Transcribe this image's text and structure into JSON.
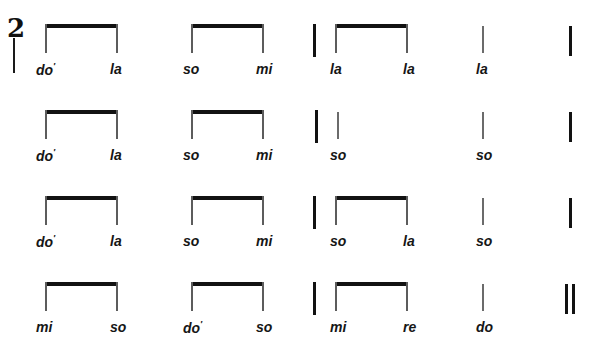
{
  "document": {
    "kind": "music-notation-rhythm-exercise",
    "notation": "stem-and-beam rhythm staff with solfege syllable labels",
    "time_signature": "2",
    "ghost_top_text": "cut-off text line"
  },
  "systems": [
    {
      "index": 1,
      "y_beam": 24,
      "y_label": 62,
      "time_signature": "2",
      "opening_barline": true,
      "closing_barline": "single",
      "measures": [
        {
          "index": 1,
          "start_barline": false,
          "groups": [
            {
              "type": "beamed-pair",
              "x": 45,
              "width": 73,
              "syllables": [
                "do'",
                "la"
              ]
            }
          ]
        },
        {
          "index": 2,
          "start_barline": false,
          "groups": [
            {
              "type": "beamed-pair",
              "x": 191,
              "width": 73,
              "syllables": [
                "so",
                "mi"
              ]
            }
          ]
        },
        {
          "index": 3,
          "start_barline": true,
          "groups": [
            {
              "type": "beamed-pair",
              "x": 335,
              "width": 73,
              "syllables": [
                "la",
                "la"
              ]
            }
          ]
        },
        {
          "index": 4,
          "start_barline": false,
          "groups": [
            {
              "type": "single-stem",
              "x": 482,
              "syllables": [
                "la"
              ]
            }
          ]
        }
      ],
      "syllable_labels": [
        {
          "text": "do",
          "prime": true,
          "x": 36
        },
        {
          "text": "la",
          "prime": false,
          "x": 110
        },
        {
          "text": "so",
          "prime": false,
          "x": 183
        },
        {
          "text": "mi",
          "prime": false,
          "x": 256
        },
        {
          "text": "la",
          "prime": false,
          "x": 330
        },
        {
          "text": "la",
          "prime": false,
          "x": 403
        },
        {
          "text": "la",
          "prime": false,
          "x": 476
        }
      ]
    },
    {
      "index": 2,
      "y_beam": 110,
      "y_label": 148,
      "time_signature": null,
      "opening_barline": false,
      "closing_barline": "single",
      "measures": [
        {
          "index": 1,
          "start_barline": false,
          "groups": [
            {
              "type": "beamed-pair",
              "x": 45,
              "width": 73,
              "syllables": [
                "do'",
                "la"
              ]
            }
          ]
        },
        {
          "index": 2,
          "start_barline": false,
          "groups": [
            {
              "type": "beamed-pair",
              "x": 191,
              "width": 73,
              "syllables": [
                "so",
                "mi"
              ]
            }
          ]
        },
        {
          "index": 3,
          "start_barline": true,
          "groups": [
            {
              "type": "single-stem",
              "x": 337,
              "syllables": [
                "so"
              ]
            }
          ]
        },
        {
          "index": 4,
          "start_barline": false,
          "groups": [
            {
              "type": "single-stem",
              "x": 482,
              "syllables": [
                "so"
              ]
            }
          ]
        }
      ],
      "syllable_labels": [
        {
          "text": "do",
          "prime": true,
          "x": 36
        },
        {
          "text": "la",
          "prime": false,
          "x": 110
        },
        {
          "text": "so",
          "prime": false,
          "x": 183
        },
        {
          "text": "mi",
          "prime": false,
          "x": 256
        },
        {
          "text": "so",
          "prime": false,
          "x": 330
        },
        {
          "text": "so",
          "prime": false,
          "x": 476
        }
      ]
    },
    {
      "index": 3,
      "y_beam": 196,
      "y_label": 234,
      "time_signature": null,
      "opening_barline": false,
      "closing_barline": "single",
      "measures": [
        {
          "index": 1,
          "start_barline": false,
          "groups": [
            {
              "type": "beamed-pair",
              "x": 45,
              "width": 73,
              "syllables": [
                "do'",
                "la"
              ]
            }
          ]
        },
        {
          "index": 2,
          "start_barline": false,
          "groups": [
            {
              "type": "beamed-pair",
              "x": 191,
              "width": 73,
              "syllables": [
                "so",
                "mi"
              ]
            }
          ]
        },
        {
          "index": 3,
          "start_barline": true,
          "groups": [
            {
              "type": "beamed-pair",
              "x": 335,
              "width": 73,
              "syllables": [
                "so",
                "la"
              ]
            }
          ]
        },
        {
          "index": 4,
          "start_barline": false,
          "groups": [
            {
              "type": "single-stem",
              "x": 482,
              "syllables": [
                "so"
              ]
            }
          ]
        }
      ],
      "syllable_labels": [
        {
          "text": "do",
          "prime": true,
          "x": 36
        },
        {
          "text": "la",
          "prime": false,
          "x": 110
        },
        {
          "text": "so",
          "prime": false,
          "x": 183
        },
        {
          "text": "mi",
          "prime": false,
          "x": 256
        },
        {
          "text": "so",
          "prime": false,
          "x": 330
        },
        {
          "text": "la",
          "prime": false,
          "x": 403
        },
        {
          "text": "so",
          "prime": false,
          "x": 476
        }
      ]
    },
    {
      "index": 4,
      "y_beam": 282,
      "y_label": 320,
      "time_signature": null,
      "opening_barline": false,
      "closing_barline": "double-final",
      "measures": [
        {
          "index": 1,
          "start_barline": false,
          "groups": [
            {
              "type": "beamed-pair",
              "x": 45,
              "width": 73,
              "syllables": [
                "mi",
                "so"
              ]
            }
          ]
        },
        {
          "index": 2,
          "start_barline": false,
          "groups": [
            {
              "type": "beamed-pair",
              "x": 191,
              "width": 73,
              "syllables": [
                "do'",
                "so"
              ]
            }
          ]
        },
        {
          "index": 3,
          "start_barline": true,
          "groups": [
            {
              "type": "beamed-pair",
              "x": 335,
              "width": 73,
              "syllables": [
                "mi",
                "re"
              ]
            }
          ]
        },
        {
          "index": 4,
          "start_barline": false,
          "groups": [
            {
              "type": "single-stem",
              "x": 482,
              "syllables": [
                "do"
              ]
            }
          ]
        }
      ],
      "syllable_labels": [
        {
          "text": "mi",
          "prime": false,
          "x": 36
        },
        {
          "text": "so",
          "prime": false,
          "x": 110
        },
        {
          "text": "do",
          "prime": true,
          "x": 183
        },
        {
          "text": "so",
          "prime": false,
          "x": 256
        },
        {
          "text": "mi",
          "prime": false,
          "x": 330
        },
        {
          "text": "re",
          "prime": false,
          "x": 403
        },
        {
          "text": "do",
          "prime": false,
          "x": 476
        }
      ]
    }
  ],
  "colors": {
    "ink": "#121212",
    "stem": "#5c5c5c",
    "paper": "#ffffff"
  },
  "prime_mark": "′"
}
